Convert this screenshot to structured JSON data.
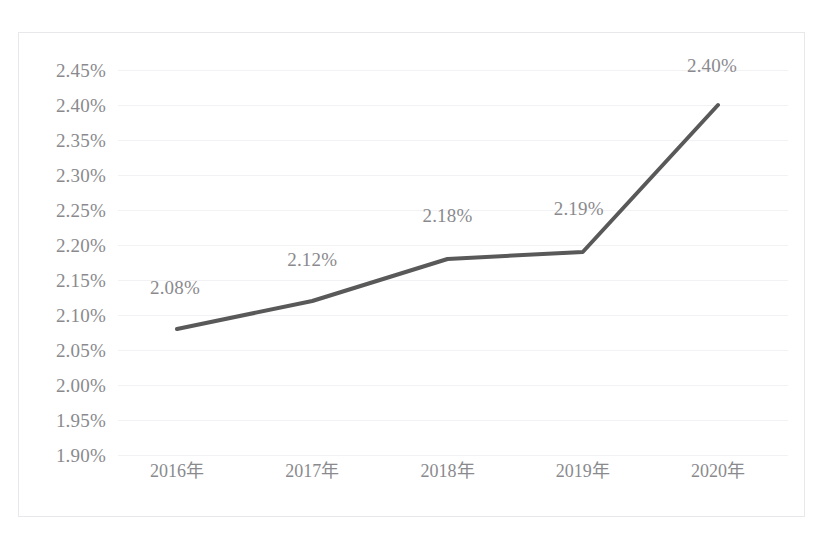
{
  "chart_data": {
    "type": "line",
    "title": "",
    "subtitle": "",
    "xlabel": "",
    "ylabel": "",
    "categories": [
      "2016年",
      "2017年",
      "2018年",
      "2019年",
      "2020年"
    ],
    "series": [
      {
        "name": "",
        "values": [
          2.08,
          2.12,
          2.18,
          2.19,
          2.4
        ],
        "value_labels": [
          "2.08%",
          "2.12%",
          "2.18%",
          "2.19%",
          "2.40%"
        ],
        "line_color": "#595959",
        "line_width": 4,
        "markers": false
      }
    ],
    "ylim": [
      1.9,
      2.45
    ],
    "ytick_values": [
      2.45,
      2.4,
      2.35,
      2.3,
      2.25,
      2.2,
      2.15,
      2.1,
      2.05,
      2.0,
      1.95,
      1.9
    ],
    "ytick_labels": [
      "2.45%",
      "2.40%",
      "2.35%",
      "2.30%",
      "2.25%",
      "2.20%",
      "2.15%",
      "2.10%",
      "2.05%",
      "2.00%",
      "1.95%",
      "1.90%"
    ],
    "grid": true,
    "grid_axis": "y",
    "grid_color": "#f2f2f4",
    "legend": false,
    "legend_position": "none",
    "data_labels_shown": true,
    "plot_background": "#ffffff",
    "frame_border_color": "#e8e8ea",
    "tick_label_color": "#8a8a8e",
    "annotations": []
  }
}
